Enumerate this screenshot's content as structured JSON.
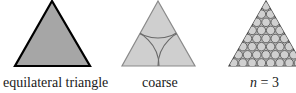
{
  "figure": {
    "panels": [
      {
        "id": "equilateral",
        "label": "equilateral triangle",
        "fill": "#a6a6a6",
        "stroke": "#000000"
      },
      {
        "id": "coarse",
        "label": "coarse",
        "fill": "#cfcfcf",
        "stroke": "#7a7a7a"
      },
      {
        "id": "fine",
        "label_var": "n",
        "label_eq": " = 3",
        "fill": "#c9c9c9",
        "circle_fill": "#cccccc",
        "stroke": "#555555"
      }
    ]
  }
}
